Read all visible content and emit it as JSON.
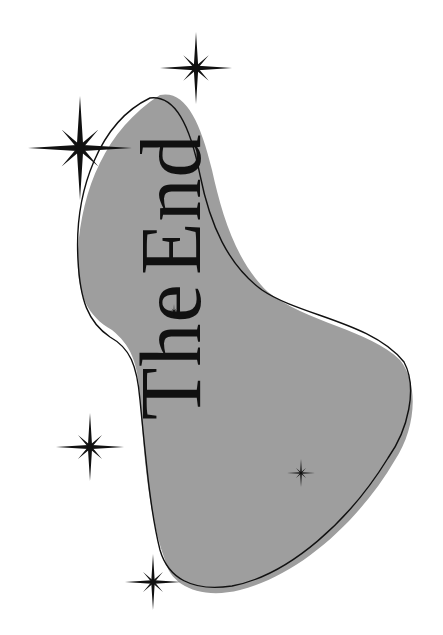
{
  "title": {
    "word1": "The",
    "word2": "End",
    "rotation_deg": -90
  },
  "colors": {
    "background": "#ffffff",
    "blob_fill": "#9e9e9e",
    "outline": "#111111",
    "text": "#111111",
    "star": "#111111"
  },
  "stars": [
    {
      "name": "star-large-top-left",
      "cx": 80,
      "cy": 148,
      "size": 52
    },
    {
      "name": "star-top",
      "cx": 196,
      "cy": 68,
      "size": 36
    },
    {
      "name": "star-mid-left",
      "cx": 90,
      "cy": 447,
      "size": 34
    },
    {
      "name": "star-bottom-left",
      "cx": 153,
      "cy": 582,
      "size": 28
    },
    {
      "name": "star-small-inside-blob",
      "cx": 301,
      "cy": 473,
      "size": 14
    },
    {
      "name": "star-tiny-on-E",
      "cx": 174,
      "cy": 311,
      "size": 7
    }
  ]
}
